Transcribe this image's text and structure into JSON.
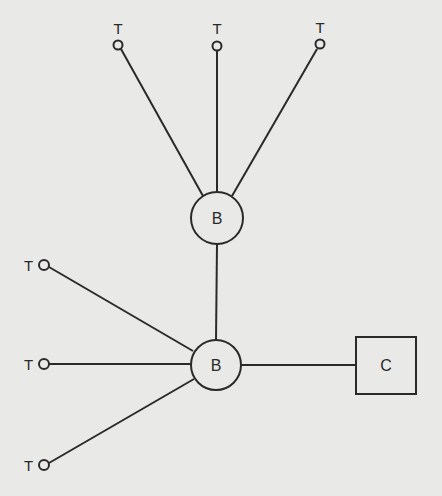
{
  "diagram": {
    "colors": {
      "background": "#e9e9e7",
      "stroke": "#2a2a2a"
    },
    "nodes": {
      "b_upper": {
        "label": "B",
        "shape": "circle"
      },
      "b_lower": {
        "label": "B",
        "shape": "circle"
      },
      "c": {
        "label": "C",
        "shape": "square"
      },
      "t1": {
        "label": "T",
        "shape": "small-circle"
      },
      "t2": {
        "label": "T",
        "shape": "small-circle"
      },
      "t3": {
        "label": "T",
        "shape": "small-circle"
      },
      "t4": {
        "label": "T",
        "shape": "small-circle"
      },
      "t5": {
        "label": "T",
        "shape": "small-circle"
      },
      "t6": {
        "label": "T",
        "shape": "small-circle"
      }
    },
    "edges": [
      [
        "t1",
        "b_upper"
      ],
      [
        "t2",
        "b_upper"
      ],
      [
        "t3",
        "b_upper"
      ],
      [
        "b_upper",
        "b_lower"
      ],
      [
        "t4",
        "b_lower"
      ],
      [
        "t5",
        "b_lower"
      ],
      [
        "t6",
        "b_lower"
      ],
      [
        "b_lower",
        "c"
      ]
    ]
  }
}
